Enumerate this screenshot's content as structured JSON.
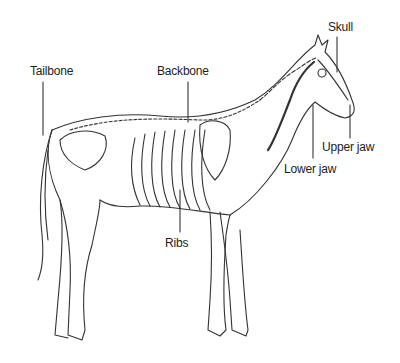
{
  "diagram": {
    "labels": [
      {
        "id": "tailbone",
        "text": "Tailbone"
      },
      {
        "id": "backbone",
        "text": "Backbone"
      },
      {
        "id": "skull",
        "text": "Skull"
      },
      {
        "id": "upper-jaw",
        "text": "Upper jaw"
      },
      {
        "id": "lower-jaw",
        "text": "Lower jaw"
      },
      {
        "id": "ribs",
        "text": "Ribs"
      }
    ]
  }
}
